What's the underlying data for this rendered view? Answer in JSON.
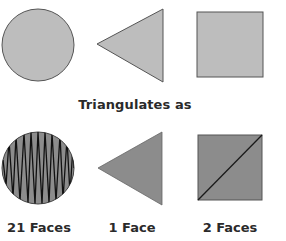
{
  "diagram": {
    "caption": "Triangulates as",
    "colors": {
      "original_fill": "#bdbdbd",
      "triangulated_fill": "#8c8c8c",
      "outline": "#555555",
      "edge": "#1a1a1a",
      "text": "#2a2a2a"
    },
    "original_shapes": [
      {
        "shape": "circle",
        "icon": "circle-shape"
      },
      {
        "shape": "triangle",
        "icon": "triangle-shape"
      },
      {
        "shape": "square",
        "icon": "square-shape"
      }
    ],
    "triangulated_shapes": [
      {
        "shape": "circle",
        "faces": 21,
        "label": "21 Faces"
      },
      {
        "shape": "triangle",
        "faces": 1,
        "label": "1 Face"
      },
      {
        "shape": "square",
        "faces": 2,
        "label": "2 Faces"
      }
    ]
  }
}
